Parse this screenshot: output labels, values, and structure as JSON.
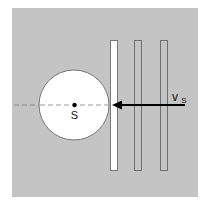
{
  "diagram": {
    "background_color": "#c4c4c4",
    "labels": {
      "center": "S",
      "velocity": "v",
      "velocity_subscript": "S"
    },
    "sphere": {
      "cx": 74,
      "cy": 105,
      "r": 35,
      "fill": "#ffffff",
      "stroke": "#777777"
    },
    "bars": [
      {
        "id": "bar-1",
        "x": 110,
        "y": 40,
        "w": 8,
        "h": 131,
        "fill": "#ffffff",
        "stroke": "#777777"
      },
      {
        "id": "bar-2",
        "x": 134,
        "y": 40,
        "w": 8,
        "h": 131,
        "fill": "none",
        "stroke": "#6f6f6f"
      },
      {
        "id": "bar-3",
        "x": 160,
        "y": 40,
        "w": 8,
        "h": 131,
        "fill": "none",
        "stroke": "#6f6f6f"
      }
    ],
    "axis_line": {
      "x1": 14,
      "x2": 110,
      "y": 105,
      "style": "dashed",
      "color": "#808080"
    },
    "arrow": {
      "x_start": 185,
      "x_end": 112,
      "y": 105,
      "color": "#000000",
      "direction": "left"
    }
  }
}
